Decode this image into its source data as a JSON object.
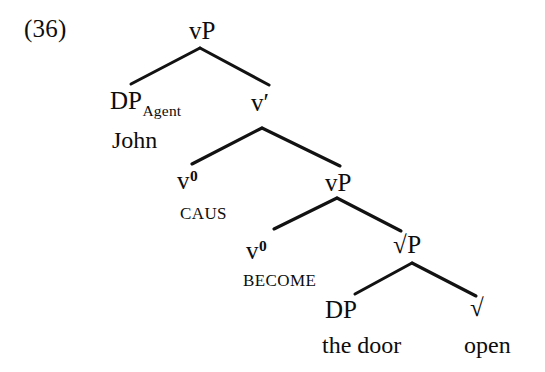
{
  "figure": {
    "example_number": "(36)",
    "caption": "",
    "sentence": "John CAUS BECOME the door open"
  },
  "tree": {
    "nodes": [
      {
        "id": "vp-root",
        "label": "vP",
        "kind": "category"
      },
      {
        "id": "dp-agent",
        "label": "DP",
        "subscript": "Agent",
        "kind": "category"
      },
      {
        "id": "john",
        "label": "John",
        "kind": "terminal"
      },
      {
        "id": "vbar",
        "label": "v′",
        "kind": "category"
      },
      {
        "id": "v0-caus",
        "label": "v",
        "superscript": "0",
        "kind": "category"
      },
      {
        "id": "caus",
        "label": "CAUS",
        "kind": "head-gloss"
      },
      {
        "id": "vp-inner",
        "label": "vP",
        "kind": "category"
      },
      {
        "id": "v0-become",
        "label": "v",
        "superscript": "0",
        "kind": "category"
      },
      {
        "id": "become",
        "label": "BECOME",
        "kind": "head-gloss"
      },
      {
        "id": "rootp",
        "label": "P",
        "radical": "√",
        "kind": "category"
      },
      {
        "id": "dp-theme",
        "label": "DP",
        "kind": "category"
      },
      {
        "id": "the-door",
        "label": "the door",
        "kind": "terminal"
      },
      {
        "id": "root-open",
        "label": "",
        "radical": "√",
        "kind": "category"
      },
      {
        "id": "open",
        "label": "open",
        "kind": "terminal"
      }
    ],
    "edges": [
      {
        "from": "vp-root",
        "to": "dp-agent",
        "x1": 200,
        "y1": 48,
        "x2": 131,
        "y2": 84
      },
      {
        "from": "vp-root",
        "to": "vbar",
        "x1": 200,
        "y1": 48,
        "x2": 269,
        "y2": 85
      },
      {
        "from": "vbar",
        "to": "v0-caus",
        "x1": 262,
        "y1": 128,
        "x2": 192,
        "y2": 164
      },
      {
        "from": "vbar",
        "to": "vp-inner",
        "x1": 262,
        "y1": 128,
        "x2": 340,
        "y2": 166
      },
      {
        "from": "vp-inner",
        "to": "v0-become",
        "x1": 337,
        "y1": 198,
        "x2": 274,
        "y2": 229
      },
      {
        "from": "vp-inner",
        "to": "rootp",
        "x1": 337,
        "y1": 198,
        "x2": 401,
        "y2": 231
      },
      {
        "from": "rootp",
        "to": "dp-theme",
        "x1": 412,
        "y1": 263,
        "x2": 355,
        "y2": 294
      },
      {
        "from": "rootp",
        "to": "root-open",
        "x1": 412,
        "y1": 263,
        "x2": 476,
        "y2": 296
      }
    ],
    "line_color": "#121212"
  },
  "colors": {
    "background": "#ffffff",
    "ink": "#0d0d0d",
    "branch": "#121212"
  }
}
